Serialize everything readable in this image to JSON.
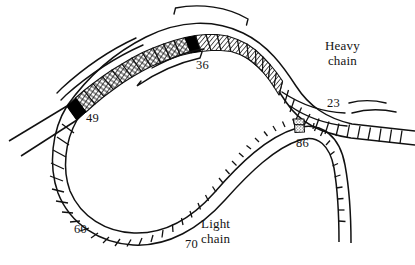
{
  "figure": {
    "type": "diagram",
    "background_color": "#ffffff",
    "ink_color": "#111111"
  },
  "labels": {
    "heavy_chain": "Heavy\nchain",
    "light_chain": "Light\nchain",
    "residue_36": "36",
    "residue_49": "49",
    "residue_23": "23",
    "residue_86": "86",
    "residue_60": "60",
    "residue_70": "70"
  },
  "chains": [
    {
      "name": "Heavy chain",
      "label": "Heavy\nchain",
      "residue_markers": [
        "36",
        "49",
        "23"
      ],
      "description": "upper chain drawn as a ladder of square residues running from lower-left, arcing over the top and descending to the right edge"
    },
    {
      "name": "Light chain",
      "label": "Light\nchain",
      "residue_markers": [
        "60",
        "70",
        "86"
      ],
      "description": "lower chain forming a large loop, crossing under the heavy chain on the right and descending to the lower-right"
    }
  ],
  "segment_fills": [
    {
      "name": "cross-hatch",
      "pattern": "crosshatch",
      "color": "#111111",
      "region": "heavy chain left arc, between residue 49 and residue 36"
    },
    {
      "name": "solid-black-49",
      "pattern": "solid",
      "color": "#000000",
      "region": "heavy chain at residue 49"
    },
    {
      "name": "solid-black-36",
      "pattern": "solid",
      "color": "#000000",
      "region": "heavy chain at residue 36"
    },
    {
      "name": "diagonal-hatch",
      "pattern": "diagonal",
      "color": "#111111",
      "region": "heavy chain right arc, from residue 36 toward residue 23"
    },
    {
      "name": "stipple-86",
      "pattern": "stipple",
      "color": "#111111",
      "region": "light chain at residue 86 where chains cross"
    },
    {
      "name": "open",
      "pattern": "none",
      "color": "#ffffff",
      "region": "remaining residues of both chains"
    }
  ],
  "brackets": [
    {
      "name": "bracket-top",
      "position": "above heavy chain apex, spanning residues around 36"
    },
    {
      "name": "bracket-upper-left",
      "position": "above the cross-hatched heavy chain segment"
    },
    {
      "name": "bracket-lower-left",
      "position": "below the cross-hatched heavy chain segment, left portion"
    },
    {
      "name": "bracket-lower-mid",
      "position": "below the heavy chain, ending at the 36 label"
    },
    {
      "name": "leader-23",
      "position": "curve from the 23 label up toward the heavy chain"
    }
  ]
}
